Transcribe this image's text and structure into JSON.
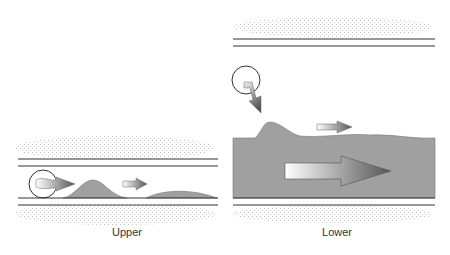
{
  "panels": [
    {
      "id": "upper",
      "label": "Upper"
    },
    {
      "id": "lower",
      "label": "Lower"
    }
  ],
  "colors": {
    "channel_line": "#333333",
    "deposit_fill": "#a0a0a0",
    "stipple": "#c8c8c8",
    "arrow_dark": "#555555",
    "arrow_light": "#ffffff"
  }
}
